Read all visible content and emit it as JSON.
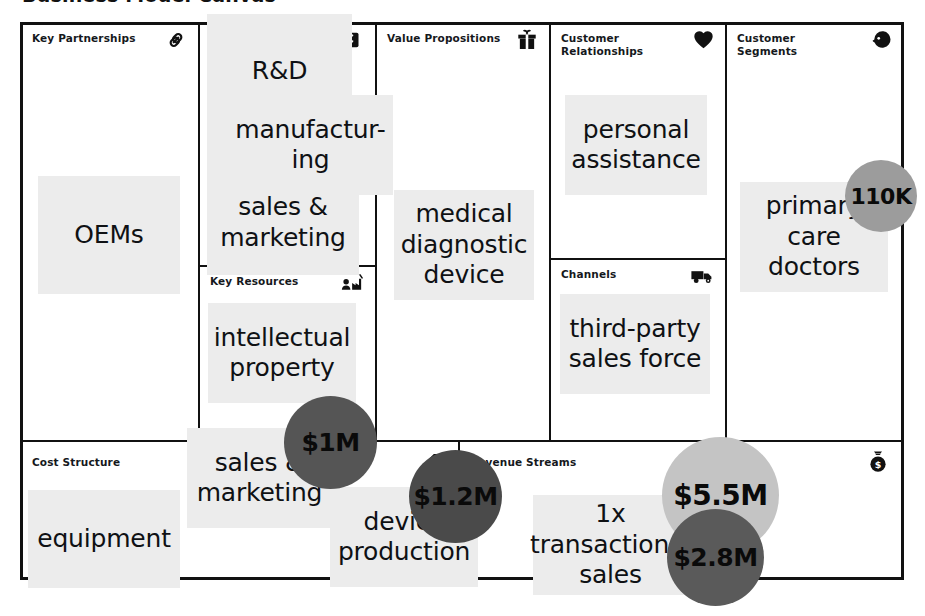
{
  "page": {
    "clipped_title": "Business Model Canvas",
    "note_bg": "#ececec",
    "line_color": "#111111"
  },
  "blocks": [
    {
      "key": "key_partnerships",
      "title": "Key Partnerships",
      "icon": "chain-link-icon"
    },
    {
      "key": "key_activities",
      "title": "Key Activities",
      "icon": "checklist-icon"
    },
    {
      "key": "key_resources",
      "title": "Key Resources",
      "icon": "worker-factory-icon"
    },
    {
      "key": "value_propositions",
      "title": "Value Propositions",
      "icon": "gift-icon"
    },
    {
      "key": "customer_relationships",
      "title": "Customer\nRelationships",
      "icon": "heart-icon"
    },
    {
      "key": "channels",
      "title": "Channels",
      "icon": "delivery-truck-icon"
    },
    {
      "key": "customer_segments",
      "title": "Customer\nSegments",
      "icon": "person-head-icon"
    },
    {
      "key": "cost_structure",
      "title": "Cost Structure",
      "icon": "price-tag-icon"
    },
    {
      "key": "revenue_streams",
      "title": "Revenue Streams",
      "icon": "money-bag-icon"
    }
  ],
  "notes": [
    {
      "id": "oems",
      "block": "key_partnerships",
      "text": "OEMs"
    },
    {
      "id": "rnd",
      "block": "key_activities",
      "text": "R&D"
    },
    {
      "id": "manufacturing",
      "block": "key_activities",
      "text": "manufactur-\ning"
    },
    {
      "id": "sales_marketing_a",
      "block": "key_activities",
      "text": "sales &\nmarketing"
    },
    {
      "id": "intellectual_prop",
      "block": "key_resources",
      "text": "intellectual\nproperty"
    },
    {
      "id": "medical_device",
      "block": "value_propositions",
      "text": "medical\ndiagnostic\ndevice"
    },
    {
      "id": "personal_assist",
      "block": "customer_relationships",
      "text": "personal\nassistance"
    },
    {
      "id": "third_party",
      "block": "channels",
      "text": "third-party\nsales force"
    },
    {
      "id": "primary_care",
      "block": "customer_segments",
      "text": "primary\ncare\ndoctors"
    },
    {
      "id": "equipment",
      "block": "cost_structure",
      "text": "equipment"
    },
    {
      "id": "sales_marketing_c",
      "block": "cost_structure",
      "text": "sales &\nmarketing"
    },
    {
      "id": "device_production",
      "block": "cost_structure",
      "text": "device\nproduction"
    },
    {
      "id": "transactional",
      "block": "revenue_streams",
      "text": "1x\ntransactional\nsales"
    }
  ],
  "bubbles": [
    {
      "id": "customers_110k",
      "label": "110K",
      "color": "#9c9c9c",
      "block": "customer_segments"
    },
    {
      "id": "cost_1m",
      "label": "$1M",
      "color": "#555555",
      "block": "cost_structure"
    },
    {
      "id": "cost_1_2m",
      "label": "$1.2M",
      "color": "#4a4a4a",
      "block": "cost_structure"
    },
    {
      "id": "revenue_5_5m",
      "label": "$5.5M",
      "color": "#c4c4c4",
      "block": "revenue_streams"
    },
    {
      "id": "revenue_2_8m",
      "label": "$2.8M",
      "color": "#5a5a5a",
      "block": "revenue_streams"
    }
  ]
}
